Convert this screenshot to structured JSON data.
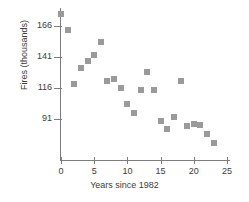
{
  "chart_data": {
    "type": "scatter",
    "title": "",
    "xlabel": "Years since 1982",
    "ylabel": "Fires (thousands)",
    "xlim": [
      -1.5,
      26
    ],
    "ylim": [
      60,
      182
    ],
    "grid": false,
    "legend": null,
    "marker_color": "#9a9a9a",
    "axis_color": "#7d7d7d",
    "xticks": [
      0,
      5,
      10,
      15,
      20,
      25
    ],
    "xtick_labels": [
      "0",
      "5",
      "10",
      "15",
      "20",
      "25"
    ],
    "yticks": [
      91,
      116,
      141,
      166
    ],
    "ytick_labels": [
      "91",
      "116",
      "141",
      "166"
    ],
    "x": [
      0,
      1,
      2,
      3,
      4,
      5,
      6,
      7,
      8,
      9,
      10,
      11,
      12,
      13,
      14,
      15,
      16,
      17,
      18,
      19,
      20,
      21,
      22,
      23
    ],
    "y": [
      176,
      163,
      119,
      132,
      138,
      143,
      153,
      122,
      123,
      116,
      103,
      96,
      114,
      129,
      114,
      89,
      83,
      93,
      122,
      85,
      87,
      86,
      79,
      72
    ],
    "points": [
      {
        "x": 0,
        "y": 176
      },
      {
        "x": 1,
        "y": 163
      },
      {
        "x": 2,
        "y": 119
      },
      {
        "x": 3,
        "y": 132
      },
      {
        "x": 4,
        "y": 138
      },
      {
        "x": 5,
        "y": 143
      },
      {
        "x": 6,
        "y": 153
      },
      {
        "x": 7,
        "y": 122
      },
      {
        "x": 8,
        "y": 123
      },
      {
        "x": 9,
        "y": 116
      },
      {
        "x": 10,
        "y": 103
      },
      {
        "x": 11,
        "y": 96
      },
      {
        "x": 12,
        "y": 114
      },
      {
        "x": 13,
        "y": 129
      },
      {
        "x": 14,
        "y": 114
      },
      {
        "x": 15,
        "y": 89
      },
      {
        "x": 16,
        "y": 83
      },
      {
        "x": 17,
        "y": 93
      },
      {
        "x": 18,
        "y": 122
      },
      {
        "x": 19,
        "y": 85
      },
      {
        "x": 20,
        "y": 87
      },
      {
        "x": 21,
        "y": 86
      },
      {
        "x": 22,
        "y": 79
      },
      {
        "x": 23,
        "y": 72
      }
    ]
  }
}
